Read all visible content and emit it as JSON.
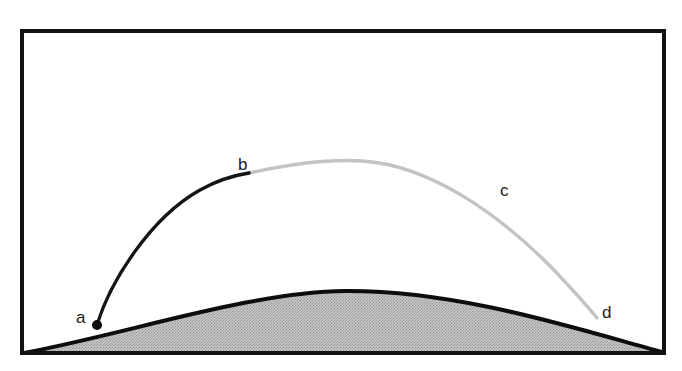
{
  "figure": {
    "kind": "line-diagram",
    "background_color": "#ffffff",
    "frame": {
      "name": "figure-border",
      "x": 22,
      "y": 31,
      "width": 642,
      "height": 322,
      "stroke_color": "#111111",
      "stroke_width": 4,
      "fill": "none"
    },
    "shaded_region": {
      "name": "hill-region",
      "fill_color": "#b9b9b9",
      "fill_pattern": "halftone-dither",
      "outline_color": "#0d0d0d",
      "outline_width": 4,
      "description": "Shaded hill / ground mass along the bottom of the frame",
      "path": "M 24 353 C 130 333, 250 292, 345 291 C 460 290, 580 330, 662 352 L 662 353 Z"
    },
    "curves": [
      {
        "name": "arc-a-to-b",
        "segment_label": "a-b",
        "color": "#151515",
        "stroke_width": 3.4,
        "from_point": "a",
        "to_point": "b",
        "path": "M 97 325 C 110 282, 150 218, 200 190 C 218 180, 236 175, 249 173"
      },
      {
        "name": "arc-b-to-d",
        "segment_label": "b-c-d",
        "color": "#c3c3c3",
        "stroke_width": 3.4,
        "from_point": "b",
        "to_point": "d",
        "path": "M 249 173 C 290 164, 330 159, 362 161 C 430 165, 500 215, 552 268 C 572 289, 588 307, 597 318"
      }
    ],
    "markers": [
      {
        "name": "point-a-dot",
        "point": "a",
        "x": 97,
        "y": 325,
        "radius": 5,
        "color": "#0d0d0d"
      }
    ],
    "labels": [
      {
        "name": "label-a",
        "text": "a",
        "x": 76,
        "y": 323
      },
      {
        "name": "label-b",
        "text": "b",
        "x": 238,
        "y": 170
      },
      {
        "name": "label-c",
        "text": "c",
        "x": 500,
        "y": 196
      },
      {
        "name": "label-d",
        "text": "d",
        "x": 602,
        "y": 318
      }
    ]
  }
}
